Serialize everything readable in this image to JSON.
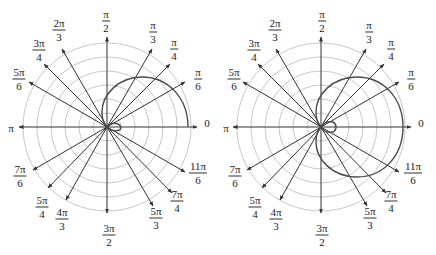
{
  "colors": {
    "grid": "#c8c8c8",
    "axis": "#333333",
    "curve": "#4a4a4a",
    "text": "#222222"
  },
  "plots": [
    {
      "id": "left",
      "cx": 107,
      "cy": 127,
      "grid_radii": [
        14,
        28,
        42,
        56,
        70,
        84
      ],
      "curve_description": "partial limacon sketch: upper outer arc plus small inner loop",
      "curve_range": "partial"
    },
    {
      "id": "right",
      "cx": 321,
      "cy": 127,
      "grid_radii": [
        14,
        28,
        42,
        56,
        70,
        84
      ],
      "curve_description": "full limacon with small inner loop",
      "curve_range": "full"
    }
  ],
  "angle_labels": [
    {
      "key": "a0",
      "num": "0",
      "den": null
    },
    {
      "key": "a30",
      "num": "π",
      "den": "6"
    },
    {
      "key": "a45",
      "num": "π",
      "den": "4"
    },
    {
      "key": "a60",
      "num": "π",
      "den": "3"
    },
    {
      "key": "a90",
      "num": "π",
      "den": "2"
    },
    {
      "key": "a120",
      "num": "2π",
      "den": "3"
    },
    {
      "key": "a135",
      "num": "3π",
      "den": "4"
    },
    {
      "key": "a150",
      "num": "5π",
      "den": "6"
    },
    {
      "key": "a180",
      "num": "π",
      "den": null
    },
    {
      "key": "a210",
      "num": "7π",
      "den": "6"
    },
    {
      "key": "a225",
      "num": "5π",
      "den": "4"
    },
    {
      "key": "a240",
      "num": "4π",
      "den": "3"
    },
    {
      "key": "a270",
      "num": "3π",
      "den": "2"
    },
    {
      "key": "a300",
      "num": "5π",
      "den": "3"
    },
    {
      "key": "a315",
      "num": "7π",
      "den": "4"
    },
    {
      "key": "a330",
      "num": "11π",
      "den": "6"
    }
  ],
  "labels": {
    "a0": "0",
    "a30_num": "π",
    "a30_den": "6",
    "a45_num": "π",
    "a45_den": "4",
    "a60_num": "π",
    "a60_den": "3",
    "a90_num": "π",
    "a90_den": "2",
    "a120_num": "2π",
    "a120_den": "3",
    "a135_num": "3π",
    "a135_den": "4",
    "a150_num": "5π",
    "a150_den": "6",
    "a180": "π",
    "a210_num": "7π",
    "a210_den": "6",
    "a225_num": "5π",
    "a225_den": "4",
    "a240_num": "4π",
    "a240_den": "3",
    "a270_num": "3π",
    "a270_den": "2",
    "a300_num": "5π",
    "a300_den": "3",
    "a315_num": "7π",
    "a315_den": "4",
    "a330_num": "11π",
    "a330_den": "6"
  }
}
